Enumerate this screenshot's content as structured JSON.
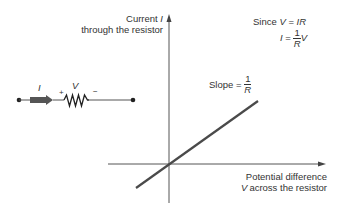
{
  "diagram": {
    "type": "ohms-law-iv-graph",
    "y_axis": {
      "label_line1": "Current",
      "label_symbol": "I",
      "label_line2": "through the resistor"
    },
    "x_axis": {
      "label_line1": "Potential difference",
      "label_symbol": "V",
      "label_line2": "across the resistor"
    },
    "equation": {
      "since_text": "Since",
      "since_lhs": "V",
      "equals": "=",
      "since_rhs": "IR",
      "result_lhs": "I",
      "fraction_num": "1",
      "fraction_den": "R",
      "result_tail": "V"
    },
    "slope": {
      "label": "Slope =",
      "fraction_num": "1",
      "fraction_den": "R"
    },
    "circuit": {
      "current_symbol": "I",
      "voltage_symbol": "V",
      "plus_sign": "+",
      "minus_sign": "−"
    },
    "colors": {
      "line": "#4a4a4a",
      "axis": "#555555",
      "text": "#333333",
      "arrow_fill": "#555555"
    }
  }
}
